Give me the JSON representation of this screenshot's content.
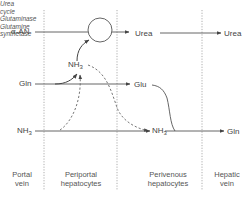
{
  "diagram": {
    "type": "metabolic-pathway",
    "zones": [
      {
        "id": "portal",
        "line1": "Portal",
        "line2": "vein"
      },
      {
        "id": "periportal",
        "line1": "Periportal",
        "line2": "hepatocytes"
      },
      {
        "id": "perivenous",
        "line1": "Perivenous",
        "line2": "hepatocytes"
      },
      {
        "id": "hepatic",
        "line1": "Hepatic",
        "line2": "vein"
      }
    ],
    "inputs": {
      "alpha_an": "α-AN",
      "gln": "Gln",
      "nh3": "NH",
      "nh3_sub": "3"
    },
    "nodes": {
      "urea_cycle_line1": "Urea",
      "urea_cycle_line2": "cycle",
      "nh3_periportal": "NH",
      "nh3_periportal_sub": "3",
      "urea_mid": "Urea",
      "urea_out": "Urea",
      "glu": "Glu",
      "nh3_perivenous": "NH",
      "nh3_perivenous_sub": "3",
      "gln_out": "Gln"
    },
    "enzymes": {
      "glutaminase": "Glutaminase",
      "glutamine_synthetase_line1": "Glutamine",
      "glutamine_synthetase_line2": "synthetase"
    },
    "colors": {
      "line": "#555555",
      "divider": "#888888",
      "text": "#444444"
    }
  }
}
